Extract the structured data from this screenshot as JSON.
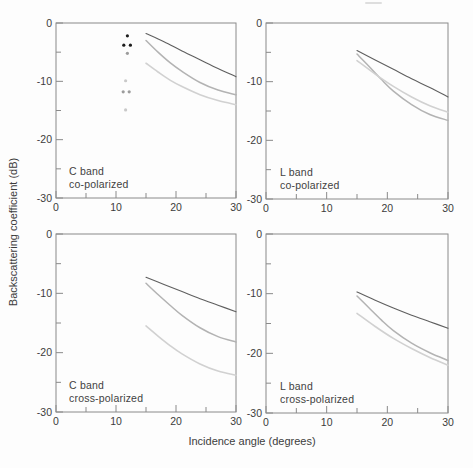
{
  "figure": {
    "xlabel": "Incidence angle (degrees)",
    "ylabel": "Backscattering coefficient (dB)"
  },
  "axes": {
    "x": {
      "min": 0,
      "max": 30,
      "major_ticks": [
        0,
        10,
        20,
        30
      ],
      "minor_ticks": [
        5,
        15,
        25
      ]
    },
    "y": {
      "min": -30,
      "max": 0,
      "major_ticks": [
        0,
        -10,
        -20,
        -30
      ],
      "minor_ticks": [
        -5,
        -15,
        -25
      ]
    }
  },
  "colors": {
    "curve_dark": "#5f5f5f",
    "curve_medium": "#b3b3b3",
    "curve_light": "#d1d1d1",
    "dot_black": "#1d1d1d",
    "dot_gray": "#9c9c9c",
    "dot_light": "#c9c9c9",
    "axis": "#8a8a8a",
    "text": "#3c3c3c"
  },
  "chart_data": [
    {
      "panel": "c-band-co-polarized",
      "type": "line",
      "band_label": "C band",
      "pol_label": "co-polarized",
      "xlim": [
        0,
        30
      ],
      "ylim": [
        -30,
        0
      ],
      "series": [
        {
          "name": "dark-solid-curve",
          "color": "curve_dark",
          "x": [
            15,
            18,
            21,
            24,
            27,
            30
          ],
          "y": [
            -1.8,
            -3.2,
            -4.8,
            -6.3,
            -7.8,
            -9.2
          ]
        },
        {
          "name": "medium-gray-curve",
          "color": "curve_medium",
          "x": [
            15,
            17,
            19,
            21,
            24,
            27,
            30
          ],
          "y": [
            -3.0,
            -5.0,
            -6.8,
            -8.3,
            -10.2,
            -11.5,
            -12.3
          ]
        },
        {
          "name": "light-gray-curve",
          "color": "curve_light",
          "x": [
            15,
            17,
            19,
            21,
            24,
            27,
            30
          ],
          "y": [
            -6.9,
            -8.4,
            -9.8,
            -10.9,
            -12.3,
            -13.3,
            -14.0
          ]
        }
      ],
      "points": [
        {
          "color": "dot_black",
          "x": 11.9,
          "y": -2.2
        },
        {
          "color": "dot_black",
          "x": 11.3,
          "y": -3.8
        },
        {
          "color": "dot_black",
          "x": 12.4,
          "y": -3.8
        },
        {
          "color": "dot_gray",
          "x": 11.9,
          "y": -5.2
        },
        {
          "color": "dot_light",
          "x": 11.6,
          "y": -9.9
        },
        {
          "color": "dot_gray",
          "x": 11.2,
          "y": -11.8
        },
        {
          "color": "dot_gray",
          "x": 12.2,
          "y": -11.8
        },
        {
          "color": "dot_light",
          "x": 11.6,
          "y": -14.9
        }
      ]
    },
    {
      "panel": "l-band-co-polarized",
      "type": "line",
      "band_label": "L band",
      "pol_label": "co-polarized",
      "xlim": [
        0,
        30
      ],
      "ylim": [
        -30,
        0
      ],
      "series": [
        {
          "name": "dark-solid-curve",
          "color": "curve_dark",
          "x": [
            15,
            18,
            21,
            24,
            27,
            30
          ],
          "y": [
            -4.7,
            -6.3,
            -7.9,
            -9.5,
            -11.0,
            -12.6
          ]
        },
        {
          "name": "medium-gray-curve",
          "color": "curve_medium",
          "x": [
            15,
            17,
            19,
            21,
            24,
            27,
            30
          ],
          "y": [
            -5.3,
            -7.4,
            -9.6,
            -11.6,
            -13.9,
            -15.6,
            -16.6
          ]
        },
        {
          "name": "light-gray-curve",
          "color": "curve_light",
          "x": [
            15,
            18,
            21,
            24,
            27,
            30
          ],
          "y": [
            -6.4,
            -8.7,
            -10.8,
            -12.6,
            -14.1,
            -15.2
          ]
        }
      ],
      "points": []
    },
    {
      "panel": "c-band-cross-polarized",
      "type": "line",
      "band_label": "C band",
      "pol_label": "cross-polarized",
      "xlim": [
        0,
        30
      ],
      "ylim": [
        -30,
        0
      ],
      "series": [
        {
          "name": "dark-solid-curve",
          "color": "curve_dark",
          "x": [
            15,
            18,
            21,
            24,
            27,
            30
          ],
          "y": [
            -7.3,
            -8.5,
            -9.7,
            -10.9,
            -12.0,
            -13.1
          ]
        },
        {
          "name": "medium-gray-curve",
          "color": "curve_medium",
          "x": [
            15,
            17,
            19,
            21,
            24,
            27,
            30
          ],
          "y": [
            -8.3,
            -10.2,
            -12.0,
            -13.7,
            -15.8,
            -17.3,
            -18.2
          ]
        },
        {
          "name": "light-gray-curve",
          "color": "curve_light",
          "x": [
            15,
            17,
            19,
            21,
            24,
            27,
            30
          ],
          "y": [
            -15.5,
            -17.2,
            -18.8,
            -20.2,
            -21.9,
            -23.1,
            -23.8
          ]
        }
      ],
      "points": []
    },
    {
      "panel": "l-band-cross-polarized",
      "type": "line",
      "band_label": "L band",
      "pol_label": "cross-polarized",
      "xlim": [
        0,
        30
      ],
      "ylim": [
        -30,
        0
      ],
      "series": [
        {
          "name": "dark-solid-curve",
          "color": "curve_dark",
          "x": [
            15,
            18,
            21,
            24,
            27,
            30
          ],
          "y": [
            -9.7,
            -11.1,
            -12.4,
            -13.6,
            -14.7,
            -15.8
          ]
        },
        {
          "name": "medium-gray-curve",
          "color": "curve_medium",
          "x": [
            15,
            17,
            19,
            21,
            24,
            27,
            30
          ],
          "y": [
            -10.4,
            -12.4,
            -14.4,
            -16.2,
            -18.3,
            -19.9,
            -21.2
          ]
        },
        {
          "name": "light-gray-curve",
          "color": "curve_light",
          "x": [
            15,
            18,
            21,
            24,
            27,
            30
          ],
          "y": [
            -13.3,
            -15.5,
            -17.5,
            -19.2,
            -20.7,
            -22.0
          ]
        }
      ],
      "points": []
    }
  ]
}
